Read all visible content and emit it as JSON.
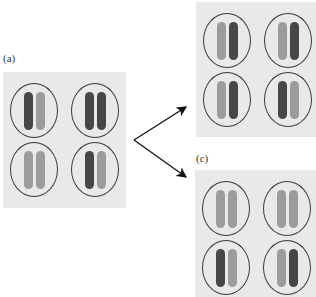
{
  "labels": {
    "a": "(a)",
    "c": "(c)"
  },
  "colors": {
    "dark": "#474747",
    "light": "#9c9c9c",
    "panel": "#e9e9e9",
    "outline": "#3a3a3a"
  },
  "panels": {
    "a": {
      "cells": [
        [
          "dark",
          "light"
        ],
        [
          "dark",
          "dark"
        ],
        [
          "light",
          "light"
        ],
        [
          "dark",
          "light"
        ]
      ]
    },
    "b": {
      "cells": [
        [
          "light",
          "dark"
        ],
        [
          "light",
          "dark"
        ],
        [
          "light",
          "dark"
        ],
        [
          "dark",
          "light"
        ]
      ]
    },
    "c": {
      "cells": [
        [
          "light",
          "light"
        ],
        [
          "light",
          "light"
        ],
        [
          "dark",
          "light"
        ],
        [
          "light",
          "dark"
        ]
      ]
    }
  },
  "arrows": [
    {
      "from": "a",
      "to": "b"
    },
    {
      "from": "a",
      "to": "c"
    }
  ]
}
